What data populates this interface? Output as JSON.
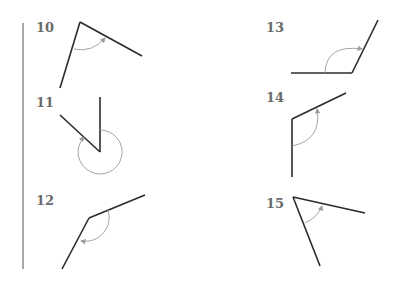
{
  "colors": {
    "line": "#2b2b2b",
    "arc": "#9a9a9a",
    "label": "#6b6b6b",
    "bar": "#a9a9a9"
  },
  "figures": [
    {
      "number": "10"
    },
    {
      "number": "11"
    },
    {
      "number": "12"
    },
    {
      "number": "13"
    },
    {
      "number": "14"
    },
    {
      "number": "15"
    }
  ]
}
